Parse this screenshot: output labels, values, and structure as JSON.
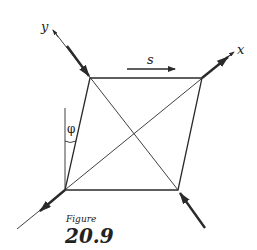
{
  "figure": {
    "caption": "Figure",
    "number": "20.9"
  },
  "labels": {
    "x_axis": "x",
    "y_axis": "y",
    "shear": "s",
    "angle": "φ"
  },
  "colors": {
    "line": "#2a2a2a",
    "background": "#ffffff"
  }
}
